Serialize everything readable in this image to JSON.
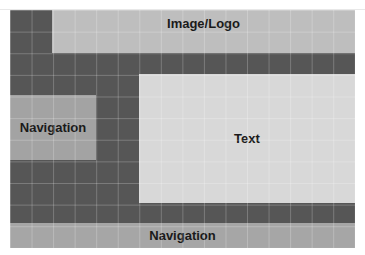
{
  "diagram": {
    "type": "wireframe-layout-grid",
    "grid": {
      "columns": 16,
      "rows": 11
    },
    "colors": {
      "background_grid": "#565656",
      "image_logo": "#bebebe",
      "navigation_left": "#a3a3a3",
      "text": "#d8d8d8",
      "navigation_bottom": "#a6a6a6",
      "label": "#1a1a1a"
    },
    "regions": {
      "image_logo": {
        "label": "Image/Logo"
      },
      "navigation_left": {
        "label": "Navigation"
      },
      "text": {
        "label": "Text"
      },
      "navigation_bottom": {
        "label": "Navigation"
      }
    }
  }
}
